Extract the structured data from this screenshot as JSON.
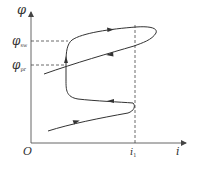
{
  "diagram": {
    "type": "hysteresis-like characteristic curve (flux vs current)",
    "axes": {
      "y_label": "φ",
      "x_label": "i",
      "origin_label": "O"
    },
    "y_marks": [
      {
        "symbol": "φ",
        "subscript": "sw",
        "pixel_y": 41
      },
      {
        "symbol": "φ",
        "subscript": "pr",
        "pixel_y": 65
      }
    ],
    "x_marks": [
      {
        "symbol": "i",
        "subscript": "1",
        "pixel_x": 135
      }
    ],
    "colors": {
      "curve": "#333333",
      "axis": "#555555",
      "dashed": "#444444",
      "background": "#ffffff"
    }
  }
}
